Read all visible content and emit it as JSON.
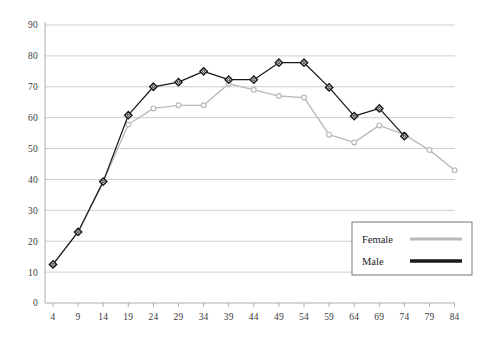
{
  "chart_data": {
    "type": "line",
    "title": "",
    "subtitle": "",
    "xlabel": "",
    "ylabel": "",
    "xlim": [
      4,
      84
    ],
    "ylim": [
      0,
      90
    ],
    "grid": true,
    "legend_position": "bottom-right",
    "categories": [
      4,
      9,
      14,
      19,
      24,
      29,
      34,
      39,
      44,
      49,
      54,
      59,
      64,
      69,
      74,
      79,
      84
    ],
    "x_tick_labels": [
      "4",
      "9",
      "14",
      "19",
      "24",
      "29",
      "34",
      "39",
      "44",
      "49",
      "54",
      "59",
      "64",
      "69",
      "74",
      "79",
      "84"
    ],
    "y_tick_labels": [
      "0",
      "10",
      "20",
      "30",
      "40",
      "50",
      "60",
      "70",
      "80",
      "90"
    ],
    "y_ticks": [
      0,
      10,
      20,
      30,
      40,
      50,
      60,
      70,
      80,
      90
    ],
    "series": [
      {
        "name": "Female",
        "color": "#b9b9b9",
        "marker": "open-circle",
        "values": [
          12.5,
          23.0,
          39.3,
          57.8,
          63.0,
          64.0,
          64.0,
          71.0,
          69.0,
          67.0,
          66.5,
          54.5,
          52.0,
          57.5,
          54.5,
          49.5,
          43.0
        ]
      },
      {
        "name": "Male",
        "color": "#1a1a1a",
        "marker": "diamond-open",
        "values": [
          12.5,
          23.0,
          39.3,
          60.8,
          70.0,
          71.5,
          75.0,
          72.3,
          72.3,
          77.8,
          77.8,
          69.8,
          60.5,
          63.0,
          54.0,
          null,
          null
        ]
      }
    ],
    "legend": [
      {
        "label": "Female",
        "color": "#b9b9b9",
        "width": 3
      },
      {
        "label": "Male",
        "color": "#1a1a1a",
        "width": 3.4
      }
    ]
  },
  "colors": {
    "female_line": "#b9b9b9",
    "male_line": "#1a1a1a",
    "gridline": "#b9b9b9",
    "axis": "#9a9a9a",
    "text": "#3a3a3a",
    "background": "#ffffff"
  }
}
